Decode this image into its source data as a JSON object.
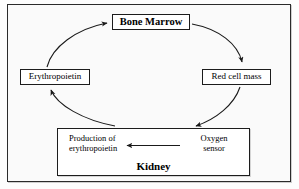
{
  "diagram": {
    "frame": {
      "border_color": "#2b2b2b",
      "background": "#fafafa"
    },
    "nodes": {
      "bone_marrow": {
        "label": "Bone Marrow",
        "emphasis": "bold"
      },
      "erythropoietin": {
        "label": "Erythropoietin",
        "emphasis": "normal"
      },
      "red_cell_mass": {
        "label": "Red cell mass",
        "emphasis": "normal"
      },
      "kidney": {
        "title": "Kidney",
        "production_line1": "Production of",
        "production_line2": "erythropoietin",
        "sensor_line1": "Oxygen",
        "sensor_line2": "sensor"
      }
    },
    "edges": [
      {
        "name": "erythropoietin-to-bone-marrow",
        "from": "Erythropoietin",
        "to": "Bone Marrow",
        "style": "curved",
        "arrowhead": "at-target"
      },
      {
        "name": "bone-marrow-to-red-cell-mass",
        "from": "Bone Marrow",
        "to": "Red cell mass",
        "style": "curved",
        "arrowhead": "at-target"
      },
      {
        "name": "red-cell-mass-to-oxygen-sensor",
        "from": "Red cell mass",
        "to": "Oxygen sensor",
        "style": "curved",
        "arrowhead": "at-target"
      },
      {
        "name": "production-to-erythropoietin",
        "from": "Production of erythropoietin",
        "to": "Erythropoietin",
        "style": "curved",
        "arrowhead": "at-target"
      },
      {
        "name": "oxygen-sensor-to-production",
        "from": "Oxygen sensor",
        "to": "Production of erythropoietin",
        "style": "straight",
        "arrowhead": "at-target",
        "direction": "left"
      }
    ],
    "colors": {
      "line": "#1a1a1a",
      "box_border": "#1c1c1c",
      "box_fill": "#ffffff",
      "page_background": "#fdfdfd"
    }
  }
}
